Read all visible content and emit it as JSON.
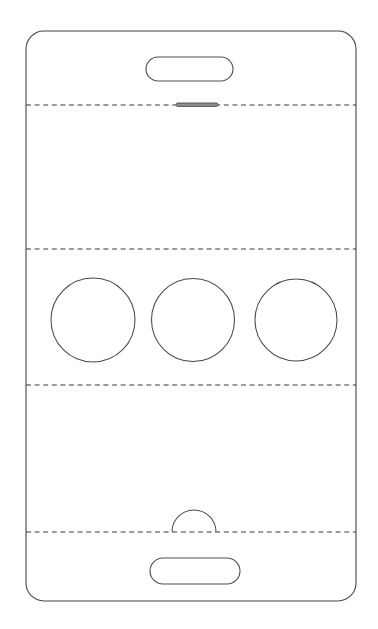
{
  "document": {
    "title": "Device Front Panel Cutting Template",
    "canvas_width": 378,
    "canvas_height": 629,
    "background_color": "#ffffff"
  },
  "style": {
    "outline_color": "#474747",
    "fold_line_color": "#3a3a3a",
    "hole_stroke_color": "#4a4a4a",
    "slot_stroke_color": "#4f4f4f",
    "speaker_fill_color": "#8e8e8e",
    "fill_color": "#ffffff",
    "stroke_width": 1.1,
    "dash_pattern": "5 3.6"
  },
  "chart_data": {
    "type": "diagram",
    "xlabel": "",
    "ylabel": "",
    "xlim": [
      0,
      378
    ],
    "ylim": [
      0,
      629
    ],
    "grid": false,
    "legend": "none",
    "shapes": [
      {
        "id": "outer-body",
        "kind": "rounded-rect",
        "label": "Device body outline",
        "x": 26,
        "y": 31,
        "width": 330,
        "height": 570,
        "corner_radius": 18
      },
      {
        "id": "fold-line-1",
        "kind": "dashed-line",
        "label": "Upper fold line",
        "x1": 26,
        "x2": 356,
        "y": 105
      },
      {
        "id": "fold-line-2",
        "kind": "dashed-line",
        "label": "Second fold line",
        "x1": 26,
        "x2": 356,
        "y": 249
      },
      {
        "id": "fold-line-3",
        "kind": "dashed-line",
        "label": "Third fold line",
        "x1": 26,
        "x2": 356,
        "y": 385
      },
      {
        "id": "fold-line-4",
        "kind": "dashed-line",
        "label": "Lower fold line",
        "x1": 26,
        "x2": 356,
        "y": 532
      },
      {
        "id": "top-slot",
        "kind": "pill",
        "label": "Top slot cutout",
        "x": 146,
        "y": 57,
        "width": 87,
        "height": 24,
        "corner_radius": 12
      },
      {
        "id": "speaker-bar",
        "kind": "bar",
        "label": "Speaker grille bar",
        "x": 176,
        "y": 103,
        "width": 42,
        "height": 3.4,
        "corner_radius": 1.7
      },
      {
        "id": "hole-left",
        "kind": "circle",
        "label": "Left circular cutout",
        "cx": 93,
        "cy": 320,
        "r": 42
      },
      {
        "id": "hole-center",
        "kind": "circle",
        "label": "Center circular cutout",
        "cx": 193,
        "cy": 320,
        "r": 41.5
      },
      {
        "id": "hole-right",
        "kind": "circle",
        "label": "Right circular cutout",
        "cx": 296,
        "cy": 320,
        "r": 41
      },
      {
        "id": "arch-tab",
        "kind": "semicircle-arch",
        "label": "Semicircular thumb notch",
        "cx": 194,
        "cy": 532,
        "r": 22
      },
      {
        "id": "bottom-slot",
        "kind": "pill",
        "label": "Bottom slot cutout",
        "x": 150,
        "y": 558,
        "width": 90,
        "height": 26,
        "corner_radius": 13
      }
    ]
  }
}
